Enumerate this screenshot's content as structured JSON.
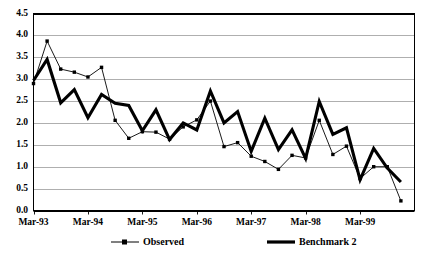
{
  "chart_data": {
    "type": "line",
    "title": "",
    "xlabel": "",
    "ylabel": "",
    "ylim": [
      0.0,
      4.5
    ],
    "ytick_values": [
      0.0,
      0.5,
      1.0,
      1.5,
      2.0,
      2.5,
      3.0,
      3.5,
      4.0,
      4.5
    ],
    "ytick_labels": [
      "0.0",
      "0.5",
      "1.0",
      "1.5",
      "2.0",
      "2.5",
      "3.0",
      "3.5",
      "4.0",
      "4.5"
    ],
    "xtick_labels": [
      "Mar-93",
      "Mar-94",
      "Mar-95",
      "Mar-96",
      "Mar-97",
      "Mar-98",
      "Mar-99"
    ],
    "xtick_indices": [
      0,
      4,
      8,
      12,
      16,
      20,
      24
    ],
    "grid": "horizontal",
    "legend_position": "bottom",
    "x": [
      "Mar-93",
      "Jun-93",
      "Sep-93",
      "Dec-93",
      "Mar-94",
      "Jun-94",
      "Sep-94",
      "Dec-94",
      "Mar-95",
      "Jun-95",
      "Sep-95",
      "Dec-95",
      "Mar-96",
      "Jun-96",
      "Sep-96",
      "Dec-96",
      "Mar-97",
      "Jun-97",
      "Sep-97",
      "Dec-97",
      "Mar-98",
      "Jun-98",
      "Sep-98",
      "Dec-98",
      "Mar-99",
      "Jun-99",
      "Sep-99",
      "Dec-99"
    ],
    "series": [
      {
        "name": "Observed",
        "style": "thin-line-with-square-markers",
        "color": "#000000",
        "values": [
          2.9,
          3.87,
          3.23,
          3.16,
          3.05,
          3.27,
          2.06,
          1.65,
          1.8,
          1.79,
          1.63,
          1.91,
          2.07,
          2.5,
          1.46,
          1.55,
          1.24,
          1.12,
          0.94,
          1.26,
          1.2,
          2.06,
          1.28,
          1.47,
          0.73,
          1.0,
          1.0,
          0.22
        ]
      },
      {
        "name": "Benchmark 2",
        "style": "thick-line",
        "color": "#000000",
        "values": [
          2.97,
          3.45,
          2.46,
          2.76,
          2.12,
          2.65,
          2.45,
          2.4,
          1.82,
          2.3,
          1.62,
          2.0,
          1.84,
          2.73,
          2.0,
          2.26,
          1.35,
          2.11,
          1.39,
          1.84,
          1.19,
          2.49,
          1.74,
          1.89,
          0.7,
          1.42,
          0.97,
          0.65
        ]
      }
    ]
  },
  "legend": {
    "observed_label": "Observed",
    "benchmark_label": "Benchmark 2"
  }
}
